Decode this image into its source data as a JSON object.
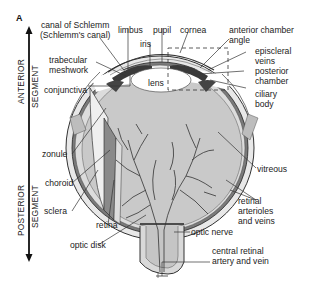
{
  "figure": {
    "panel_label": "A",
    "axis": {
      "top_segment": [
        "ANTERIOR",
        "SEGMENT"
      ],
      "bottom_segment": [
        "POSTERIOR",
        "SEGMENT"
      ]
    },
    "labels": {
      "canal_line1": "canal of Schlemm",
      "canal_line2": "(Schlemm's canal)",
      "limbus": "limbus",
      "pupil": "pupil",
      "cornea": "cornea",
      "iris": "iris",
      "acangle_line1": "anterior chamber",
      "acangle_line2": "angle",
      "trabecular_line1": "trabecular",
      "trabecular_line2": "meshwork",
      "episcleral_line1": "episcleral",
      "episcleral_line2": "veins",
      "lens": "lens",
      "posterior_line1": "posterior",
      "posterior_line2": "chamber",
      "conjunctiva": "conjunctiva",
      "ciliary_line1": "ciliary",
      "ciliary_line2": "body",
      "zonule": "zonule",
      "vitreous": "vitreous",
      "choroid": "choroid",
      "sclera": "sclera",
      "retinal_line1": "retinal",
      "retinal_line2": "arterioles",
      "retinal_line3": "and veins",
      "retina": "retina",
      "optic_nerve": "optic nerve",
      "optic_disk": "optic disk",
      "central_line1": "central retinal",
      "central_line2": "artery and vein"
    },
    "colors": {
      "vitreous_fill": "#c9c9c9",
      "sclera_fill": "#e6e6e6",
      "choroid_fill": "#6e6e6e",
      "vessel": "#333333",
      "text": "#222222"
    }
  }
}
